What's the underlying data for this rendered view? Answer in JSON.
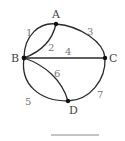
{
  "diagram": {
    "type": "graph",
    "nodes": [
      {
        "id": "A",
        "label": "A"
      },
      {
        "id": "B",
        "label": "B"
      },
      {
        "id": "C",
        "label": "C"
      },
      {
        "id": "D",
        "label": "D"
      }
    ],
    "edges": [
      {
        "id": "1",
        "label": "1",
        "from": "B",
        "to": "A"
      },
      {
        "id": "2",
        "label": "2",
        "from": "B",
        "to": "A"
      },
      {
        "id": "3",
        "label": "3",
        "from": "A",
        "to": "C"
      },
      {
        "id": "4",
        "label": "4",
        "from": "B",
        "to": "C"
      },
      {
        "id": "5",
        "label": "5",
        "from": "B",
        "to": "D"
      },
      {
        "id": "6",
        "label": "6",
        "from": "B",
        "to": "D"
      },
      {
        "id": "7",
        "label": "7",
        "from": "D",
        "to": "C"
      }
    ]
  }
}
